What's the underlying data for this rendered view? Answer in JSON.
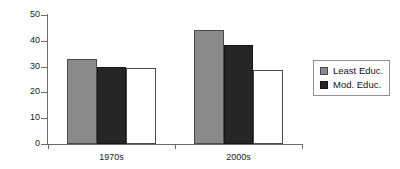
{
  "chart_data": {
    "type": "bar",
    "title": "",
    "subtitle": "",
    "xlabel": "",
    "ylabel": "",
    "categories": [
      "1970s",
      "2000s"
    ],
    "series": [
      {
        "name": "Least Educ.",
        "color": "#8a8a8a",
        "values": [
          33,
          44
        ]
      },
      {
        "name": "Mod. Educ.",
        "color": "#262626",
        "values": [
          30,
          38.5
        ]
      },
      {
        "name": "",
        "color": "#ffffff",
        "values": [
          29.5,
          28.5
        ]
      }
    ],
    "ylim": [
      0,
      50
    ],
    "ytick_labels": [
      "0",
      "10",
      "20",
      "30",
      "40",
      "50"
    ],
    "ytick_values": [
      0,
      10,
      20,
      30,
      40,
      50
    ],
    "grid": false,
    "legend_position": "right",
    "legend_entries": [
      {
        "label": "Least Educ.",
        "swatch": "#8a8a8a"
      },
      {
        "label": "Mod. Educ.",
        "swatch": "#262626"
      }
    ]
  }
}
